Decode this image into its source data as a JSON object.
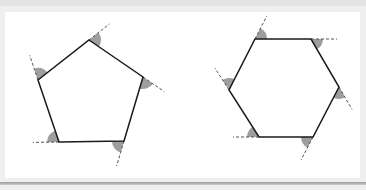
{
  "figure": {
    "colors": {
      "background": "#efefef",
      "panel": "#ffffff",
      "edge": "#1a1a1a",
      "extension": "#555555",
      "angle_fill": "#9e9e9e"
    },
    "shapes": [
      {
        "name": "pentagon",
        "sides": 5,
        "vertices": [
          [
            89,
            40
          ],
          [
            143,
            77
          ],
          [
            124,
            141
          ],
          [
            59,
            142
          ],
          [
            38,
            80
          ]
        ]
      },
      {
        "name": "hexagon",
        "sides": 6,
        "vertices": [
          [
            255,
            39
          ],
          [
            311,
            39
          ],
          [
            339,
            87
          ],
          [
            313,
            137
          ],
          [
            259,
            137
          ],
          [
            229,
            90
          ]
        ]
      }
    ]
  }
}
